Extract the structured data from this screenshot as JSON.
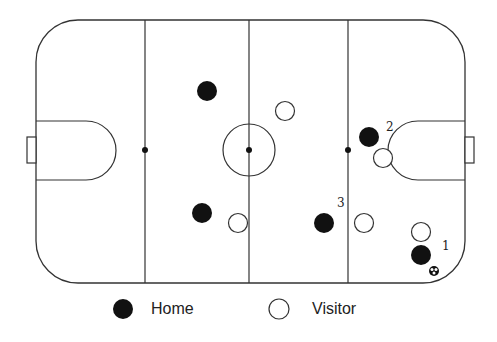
{
  "diagram": {
    "type": "hockey-rink-player-positions",
    "colors": {
      "line": "#333333",
      "home_fill": "#111111",
      "visitor_fill": "#ffffff"
    },
    "home_players": [
      {
        "x": 207,
        "y": 91,
        "label": ""
      },
      {
        "x": 202,
        "y": 213,
        "label": ""
      },
      {
        "x": 324,
        "y": 223,
        "label": "3"
      },
      {
        "x": 369,
        "y": 137,
        "label": "2"
      },
      {
        "x": 421,
        "y": 255,
        "label": "1"
      }
    ],
    "visitor_players": [
      {
        "x": 285,
        "y": 111
      },
      {
        "x": 238,
        "y": 223
      },
      {
        "x": 364,
        "y": 223
      },
      {
        "x": 383,
        "y": 158
      },
      {
        "x": 421,
        "y": 232
      }
    ],
    "number_labels": [
      {
        "text": "2",
        "x": 386,
        "y": 131
      },
      {
        "text": "3",
        "x": 337,
        "y": 207
      },
      {
        "text": "1",
        "x": 442,
        "y": 250
      }
    ],
    "puck": {
      "x": 434,
      "y": 271
    }
  },
  "legend": {
    "home_label": "Home",
    "visitor_label": "Visitor"
  }
}
